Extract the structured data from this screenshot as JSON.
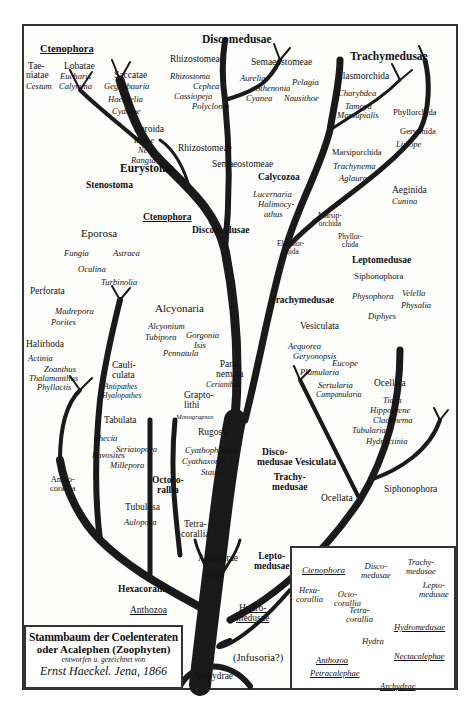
{
  "title_box": {
    "line1": "Stammbaum der Coelenteraten",
    "line2": "oder Acalephen (Zoophyten)",
    "line3": "entworfen u. gezeichnet von",
    "line4": "Ernst Haeckel. Jena, 1866"
  },
  "groups": {
    "ctenophora": {
      "title": "Ctenophora",
      "items": [
        "Tae-",
        "niatae",
        "Cestum",
        "Lobatae",
        "Eucharis",
        "Calymma",
        "Saccatae",
        "Gegenbauria",
        "Haeckelia",
        "Cydippe",
        "Beroida",
        "Beroe",
        "Neis",
        "Rangia"
      ]
    },
    "discomedusae": {
      "title": "Discomedusae",
      "rhizo": "Rhizostomeae",
      "rhizo_items": [
        "Rhizostoma",
        "Cephea",
        "Cassiopeja",
        "Polyclonia"
      ],
      "semaeo": "Semaeostomeae",
      "semaeo_items": [
        "Aurelia",
        "Pelagia",
        "Sthenonia",
        "Cyanea",
        "Nausithoe"
      ]
    },
    "trachymedusae": {
      "title": "Trachymedusae",
      "elasmo": "Elasmorchida",
      "elasmo_items": [
        "Charybdea",
        "Tamoya",
        "Marsupialis"
      ],
      "phyllo": "Phyllorchida",
      "geryonida": "Geryonida",
      "geryonida_items": [
        "Liriope"
      ],
      "marsipo": "Marsiporchida",
      "marsipo_items": [
        "Trachynema",
        "Aglaura"
      ],
      "aeginida": "Aeginida",
      "aeginida_items": [
        "Cunina"
      ]
    },
    "calycozoa": {
      "title": "Calycozoa",
      "items": [
        "Lucernaria",
        "Halimocy-",
        "athus"
      ]
    },
    "eporosa": {
      "title": "Eporosa",
      "items": [
        "Fungia",
        "Astraea",
        "Oculina",
        "Turbinolia"
      ]
    },
    "perforata": {
      "title": "Perforata",
      "items": [
        "Madrepora",
        "Porites"
      ]
    },
    "halirhoda": {
      "title": "Halirhoda",
      "items": [
        "Actinia",
        "Zoanthus",
        "Thalamanthus",
        "Phyllactis"
      ]
    },
    "cauliculata": {
      "title": "Cauli-",
      "title2": "culata",
      "items": [
        "Antipathes",
        "Hyalopathes"
      ]
    },
    "alcyonaria": {
      "title": "Alcyonaria",
      "items": [
        "Alcyonium",
        "Tubipora",
        "Gorgonia",
        "Isis",
        "Pennatula"
      ]
    },
    "paranemata": {
      "title": "Para-",
      "title2": "nemata",
      "items": [
        "Cerianthus"
      ]
    },
    "graptolithi": {
      "title": "Grapto-",
      "title2": "lithi",
      "items": [
        "Monograpsus"
      ]
    },
    "rugosa": {
      "title": "Rugosa",
      "items": [
        "Cyathophyllum",
        "Cyathaxonia",
        "Stauria"
      ]
    },
    "tabulata": {
      "title": "Tabulata",
      "items": [
        "Thecia",
        "Seriatopora",
        "Favosites",
        "Millepora"
      ]
    },
    "tubulosa": {
      "title": "Tubulosa",
      "items": [
        "Aulopora"
      ]
    },
    "archydrae": {
      "title": "Archydrae",
      "items": [
        "Hydra"
      ]
    },
    "leptomedusae": {
      "title": "Leptomedusae",
      "sipho": "Siphonophora",
      "sipho_items": [
        "Physophora",
        "Velella",
        "Physalia",
        "Diphyes"
      ]
    },
    "vesiculata": {
      "title": "Vesiculata",
      "items": [
        "Aequorea",
        "Geryonopsis",
        "Eucope",
        "Plumularia",
        "Sertularia",
        "Campanularia"
      ]
    },
    "ocellata": {
      "title": "Ocellata",
      "items": [
        "Tiara",
        "Hippocrene",
        "Cladonema",
        "Tubularia",
        "Hydractinia"
      ]
    }
  },
  "branch_labels": {
    "eurystoma": "Eurystoma",
    "stenostoma": "Stenostoma",
    "ctenophora": "Ctenophora",
    "discomedusae": "Discomedusae",
    "rhizostomeae": "Rhizostomeae",
    "semaeostomeae": "Semaeostomeae",
    "marsiporchida": [
      "Marsip-",
      "orchida"
    ],
    "elasmorchida": [
      "Elasmor-",
      "chida"
    ],
    "phyllorchida": [
      "Phyllor-",
      "chida"
    ],
    "trachymedusae": "Trachymedusae",
    "anthocorallia": [
      "Antho-",
      "corallia"
    ],
    "octocorallia": [
      "Octoco-",
      "rallia"
    ],
    "tetracorallia": [
      "Tetra-",
      "corallia"
    ],
    "hexacorallia": "Hexacorallia",
    "anthozoa": "Anthozoa",
    "disco_medusae": [
      "Disco-",
      "medusae"
    ],
    "trachy_medusae": [
      "Trachy-",
      "medusae"
    ],
    "vesiculata": "Vesiculata",
    "ocellata": "Ocellata",
    "siphonophora": "Siphonophora",
    "leptomedusae": [
      "Lepto-",
      "medusae"
    ],
    "hydromedusae": [
      "Hydro-",
      "medusae"
    ],
    "infusoria": "(Jnfusoria?)",
    "archydrae_root": "Archydrae"
  },
  "inset": {
    "top_labels": [
      "Ctenophora",
      "Disco-",
      "medusae",
      "Trachy-",
      "medusae",
      "Lepto-",
      "medusae"
    ],
    "hexacorallia": [
      "Hexa-",
      "corallia"
    ],
    "octocorallia": [
      "Octo-",
      "corallia"
    ],
    "tetracorallia": [
      "Tetra-",
      "corallia"
    ],
    "hydromedusae": "Hydromedusae",
    "hydra": "Hydra",
    "anthozoa": "Anthozoa",
    "nectacalephae": "Nectacalephae",
    "petracalephae": "Petracalephae",
    "archydrae": "Archydrae"
  },
  "colors": {
    "ink": "#111111",
    "paper": "#fdfdfb",
    "frame": "#333333"
  }
}
